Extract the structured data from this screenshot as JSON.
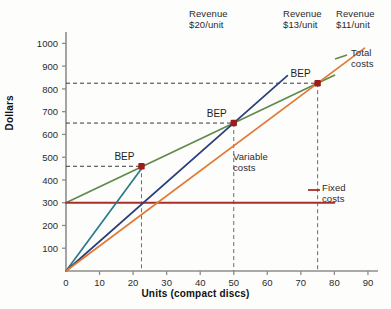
{
  "chart_data": {
    "type": "line",
    "title": "",
    "xlabel": "Units (compact discs)",
    "ylabel": "Dollars",
    "xlim": [
      0,
      93
    ],
    "ylim": [
      0,
      1050
    ],
    "xticks": [
      0,
      10,
      20,
      30,
      40,
      50,
      60,
      70,
      80,
      90
    ],
    "yticks": [
      100,
      200,
      300,
      400,
      500,
      600,
      700,
      800,
      900,
      1000
    ],
    "grid": false,
    "legend_position": "inline-annotations",
    "series": [
      {
        "name": "Revenue $20/unit",
        "label": "Revenue\n$20/unit",
        "label_line1": "Revenue",
        "label_line2": "$20/unit",
        "color": "#2a7b87",
        "slope": 20,
        "intercept": 0,
        "x": [
          0,
          23.3
        ],
        "y": [
          0,
          466
        ]
      },
      {
        "name": "Revenue $13/unit",
        "label_line1": "Revenue",
        "label_line2": "$13/unit",
        "color": "#2b3f7a",
        "slope": 13,
        "intercept": 0,
        "x": [
          0,
          66
        ],
        "y": [
          0,
          858
        ]
      },
      {
        "name": "Revenue $11/unit",
        "label_line1": "Revenue",
        "label_line2": "$11/unit",
        "color": "#e07a35",
        "slope": 11,
        "intercept": 0,
        "x": [
          0,
          89
        ],
        "y": [
          0,
          979
        ]
      },
      {
        "name": "Total costs",
        "label_line1": "Total",
        "label_line2": "costs",
        "color": "#5f8a4a",
        "slope": 7,
        "intercept": 300,
        "x": [
          0,
          80
        ],
        "y": [
          300,
          860
        ]
      },
      {
        "name": "Fixed costs",
        "label_line1": "Fixed",
        "label_line2": "costs",
        "color": "#a82f2a",
        "slope": 0,
        "intercept": 300,
        "x": [
          0,
          80
        ],
        "y": [
          300,
          300
        ]
      }
    ],
    "breakeven_points": [
      {
        "label": "BEP",
        "x": 22.5,
        "y": 460,
        "marker_color": "#9e1b1b"
      },
      {
        "label": "BEP",
        "x": 50,
        "y": 650,
        "marker_color": "#9e1b1b"
      },
      {
        "label": "BEP",
        "x": 75,
        "y": 825,
        "marker_color": "#9e1b1b"
      }
    ],
    "annotations": [
      {
        "name": "variable-costs",
        "line1": "Variable",
        "line2": "costs",
        "x": 57,
        "y": 490
      }
    ]
  },
  "axis": {
    "x_title": "Units (compact discs)",
    "y_title": "Dollars",
    "x_tick_labels": [
      "0",
      "10",
      "20",
      "30",
      "40",
      "50",
      "60",
      "70",
      "80",
      "90"
    ],
    "y_tick_labels": [
      "100",
      "200",
      "300",
      "400",
      "500",
      "600",
      "700",
      "800",
      "900",
      "1000"
    ]
  },
  "colors": {
    "revenue20": "#2a7b87",
    "revenue13": "#2b3f7a",
    "revenue11": "#e07a35",
    "total_costs": "#5f8a4a",
    "fixed_costs": "#a82f2a",
    "bep_marker": "#9e1b1b",
    "axis": "#8d8d8d",
    "guide": "#3a3a3a"
  }
}
